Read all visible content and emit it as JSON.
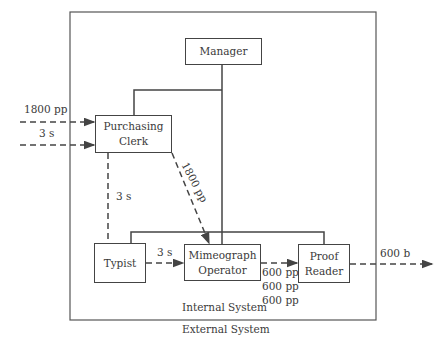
{
  "diagram": {
    "nodes": {
      "manager": "Manager",
      "purchasing_clerk_l1": "Purchasing",
      "purchasing_clerk_l2": "Clerk",
      "typist": "Typist",
      "mimeograph_l1": "Mimeograph",
      "mimeograph_l2": "Operator",
      "proof_l1": "Proof",
      "proof_l2": "Reader"
    },
    "flows": {
      "input_pages": "1800 pp",
      "input_stencils": "3 s",
      "clerk_to_typist": "3 s",
      "clerk_to_mimeograph": "1800 pp",
      "typist_to_mimeograph": "3 s",
      "mimeo_to_proof_1": "600 pp",
      "mimeo_to_proof_2": "600 pp",
      "mimeo_to_proof_3": "600 pp",
      "output": "600 b"
    },
    "boundaries": {
      "internal": "Internal System",
      "external": "External System"
    },
    "colors": {
      "line": "#444444",
      "text": "#3a3a3a",
      "background": "#ffffff"
    }
  }
}
